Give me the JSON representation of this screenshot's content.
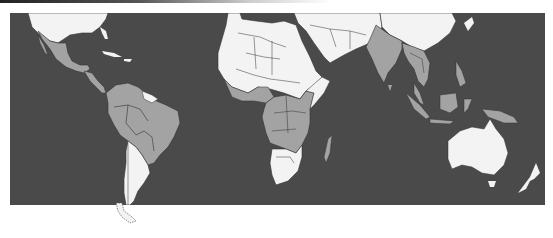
{
  "map": {
    "type": "choropleth world map (equatorial/tropical crop)",
    "colors": {
      "ocean": "#4a4a4a",
      "land_light": "#f3f3f3",
      "land_shaded": "#a3a3a3",
      "border": "#333333"
    },
    "shaded_regions": [
      "Mexico",
      "Central America",
      "Colombia",
      "Venezuela",
      "Peru",
      "Ecuador",
      "Bolivia",
      "Brazil",
      "Paraguay",
      "West Africa (coastal)",
      "Nigeria",
      "Central Africa",
      "East Africa",
      "Mozambique",
      "Madagascar",
      "India",
      "Myanmar",
      "Thailand",
      "Indochina",
      "Malaysia",
      "Indonesia",
      "Papua New Guinea"
    ],
    "light_regions": [
      "United States",
      "Guyana/Suriname",
      "Argentina",
      "Chile",
      "Uruguay",
      "North Africa",
      "Sahel",
      "Southern Africa",
      "Middle East",
      "China",
      "Australia",
      "New Zealand"
    ]
  }
}
